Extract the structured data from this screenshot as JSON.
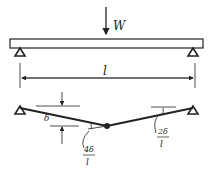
{
  "diagram": {
    "type": "simply-supported-beam-collapse-mechanism",
    "load": {
      "label": "W",
      "position": "midspan"
    },
    "span": {
      "label": "l"
    },
    "deflection": {
      "label": "δ"
    },
    "rotations": {
      "hinge": {
        "numerator": "4δ",
        "denominator": "l"
      },
      "support": {
        "numerator": "2δ",
        "denominator": "l"
      }
    },
    "colors": {
      "ink": "#222222",
      "background": "#ffffff"
    }
  }
}
